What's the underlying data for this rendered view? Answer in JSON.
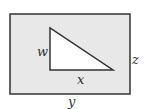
{
  "diagram": {
    "type": "geometry",
    "colors": {
      "rect_fill": "#e8e8e8",
      "triangle_fill": "#ffffff",
      "stroke": "#333333"
    },
    "labels": {
      "w": "w",
      "x": "x",
      "y": "y",
      "z": "z"
    }
  }
}
